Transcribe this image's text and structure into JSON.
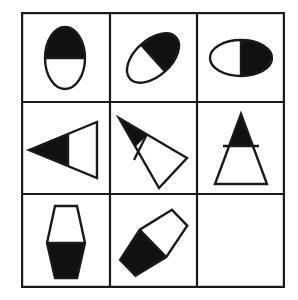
{
  "puzzle": {
    "title": "Visual Analogy Matrix",
    "type": "raven-progressive-matrix",
    "rows": 3,
    "columns": 3,
    "stroke_color": "#1a1a1a",
    "fill_color": "#111111",
    "background_color": "#ffffff",
    "blank_cell_index": 8,
    "cells": [
      {
        "index": 0,
        "position": "row-1-col-1",
        "shape": "ellipse",
        "rotation_deg": 0,
        "shaded_half": "top",
        "shaded_fraction": 0.5,
        "empty": false,
        "label": "Vertical ellipse, top half filled"
      },
      {
        "index": 1,
        "position": "row-1-col-2",
        "shape": "ellipse",
        "rotation_deg": -42,
        "shaded_half": "leading",
        "shaded_fraction": 0.5,
        "empty": false,
        "label": "Tilted ellipse, upper-right half filled"
      },
      {
        "index": 2,
        "position": "row-1-col-3",
        "shape": "ellipse",
        "rotation_deg": -90,
        "shaded_half": "right",
        "shaded_fraction": 0.5,
        "empty": false,
        "label": "Horizontal ellipse, right half filled"
      },
      {
        "index": 3,
        "position": "row-2-col-1",
        "shape": "triangle",
        "rotation_deg": -90,
        "shaded_half": "apex",
        "shaded_fraction": 0.45,
        "empty": false,
        "label": "Triangle pointing left, apex portion filled"
      },
      {
        "index": 4,
        "position": "row-2-col-2",
        "shape": "triangle",
        "rotation_deg": -48,
        "shaded_half": "apex",
        "shaded_fraction": 0.42,
        "empty": false,
        "label": "Tilted triangle pointing upper-left, apex portion filled"
      },
      {
        "index": 5,
        "position": "row-2-col-3",
        "shape": "triangle",
        "rotation_deg": 0,
        "shaded_half": "apex",
        "shaded_fraction": 0.45,
        "empty": false,
        "label": "Triangle pointing up, apex portion filled"
      },
      {
        "index": 6,
        "position": "row-3-col-1",
        "shape": "hexagon",
        "rotation_deg": 0,
        "shaded_half": "bottom",
        "shaded_fraction": 0.5,
        "empty": false,
        "label": "Upright hexagon, bottom half filled"
      },
      {
        "index": 7,
        "position": "row-3-col-2",
        "shape": "hexagon",
        "rotation_deg": 46,
        "shaded_half": "trailing",
        "shaded_fraction": 0.5,
        "empty": false,
        "label": "Tilted hexagon, lower-left half filled"
      },
      {
        "index": 8,
        "position": "row-3-col-3",
        "shape": "none",
        "rotation_deg": 0,
        "shaded_half": "none",
        "shaded_fraction": 0,
        "empty": true,
        "label": "Blank answer cell"
      }
    ]
  }
}
